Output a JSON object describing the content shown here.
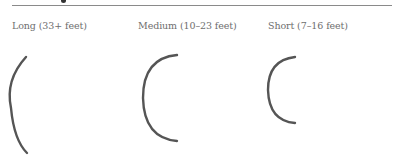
{
  "header": {
    "rule": true
  },
  "categories": [
    {
      "label": "Long (33+ feet)",
      "x": 12
    },
    {
      "label": "Medium (10–23 feet)",
      "x": 138
    },
    {
      "label": "Short (7–16 feet)",
      "x": 268
    }
  ],
  "arcs": [
    {
      "name": "long",
      "top": [
        26,
        57
      ],
      "left": [
        12,
        104
      ],
      "bottom": [
        27,
        153
      ]
    },
    {
      "name": "medium",
      "top": [
        177,
        55
      ],
      "left": [
        143,
        98
      ],
      "bottom": [
        177,
        141
      ]
    },
    {
      "name": "short",
      "top": [
        295,
        57
      ],
      "left": [
        268,
        90
      ],
      "bottom": [
        295,
        123
      ]
    }
  ],
  "colors": {
    "stroke": "#555555",
    "text": "#6e6e6e",
    "rule": "#8a8a8a"
  }
}
